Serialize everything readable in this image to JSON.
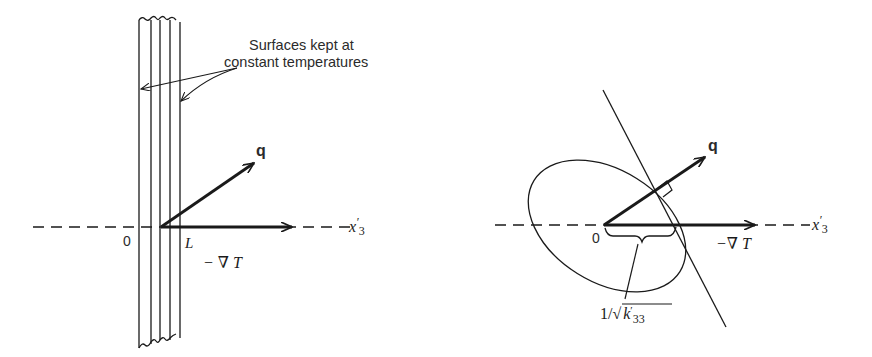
{
  "figure": {
    "left_panel": {
      "annotation_line1": "Surfaces kept at",
      "annotation_line2": "constant temperatures",
      "origin_label": "0",
      "thickness_label": "L",
      "flux_label": "q",
      "gradient_label": "− ∇ T",
      "axis_label": "x",
      "axis_prime": "′",
      "axis_sub": "3"
    },
    "right_panel": {
      "origin_label": "0",
      "flux_label": "q",
      "gradient_label": "−∇ T",
      "axis_label": "x",
      "axis_prime": "′",
      "axis_sub": "3",
      "intercept_label_prefix": "1/√",
      "intercept_label_k": "k",
      "intercept_label_prime": "′",
      "intercept_label_sub": "33"
    },
    "colors": {
      "ink": "#1a1a1a",
      "background": "#ffffff"
    }
  }
}
